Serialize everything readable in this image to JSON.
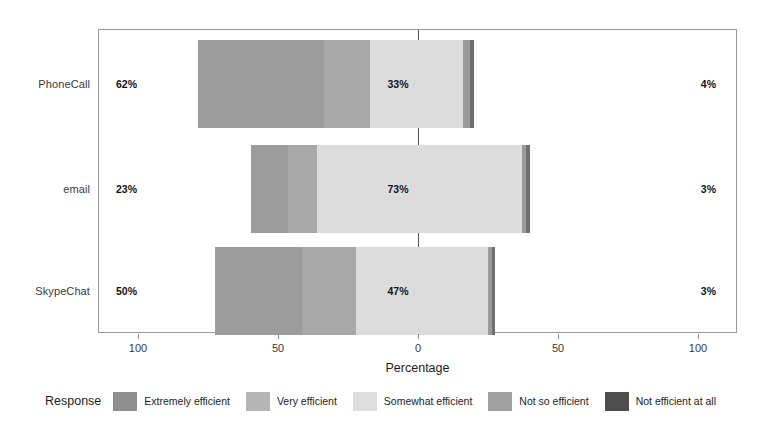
{
  "chart_data": {
    "type": "bar",
    "subtype": "diverging-stacked-likert",
    "title": "",
    "xlabel": "Percentage",
    "ylabel": "",
    "categories": [
      "PhoneCall",
      "email",
      "SkypeChat"
    ],
    "response_levels": [
      "Extremely efficient",
      "Very efficient",
      "Somewhat efficient",
      "Not so efficient",
      "Not efficient at all"
    ],
    "series": [
      {
        "name": "Extremely efficient",
        "values": [
          45,
          12,
          31
        ]
      },
      {
        "name": "Very efficient",
        "values": [
          17,
          11,
          19
        ]
      },
      {
        "name": "Somewhat efficient",
        "values": [
          33,
          73,
          47
        ]
      },
      {
        "name": "Not so efficient",
        "values": [
          3,
          2,
          2
        ]
      },
      {
        "name": "Not efficient at all",
        "values": [
          1,
          1,
          1
        ]
      }
    ],
    "bars": [
      {
        "category": "PhoneCall",
        "left_label": "62%",
        "center_label": "33%",
        "right_label": "4%",
        "start_pct": -78.5,
        "segments": [
          {
            "level": "Extremely efficient",
            "width_pct": 45.0,
            "color": "#9c9c9c"
          },
          {
            "level": "Very efficient",
            "width_pct": 16.5,
            "color": "#a8a8a8"
          },
          {
            "level": "Somewhat efficient",
            "width_pct": 33.0,
            "color": "#dcdcdc"
          },
          {
            "level": "Not so efficient",
            "width_pct": 2.5,
            "color": "#9a9a9a"
          },
          {
            "level": "Not efficient at all",
            "width_pct": 1.5,
            "color": "#6f6f6f"
          }
        ]
      },
      {
        "category": "email",
        "left_label": "23%",
        "center_label": "73%",
        "right_label": "3%",
        "start_pct": -59.5,
        "segments": [
          {
            "level": "Extremely efficient",
            "width_pct": 13.0,
            "color": "#9c9c9c"
          },
          {
            "level": "Very efficient",
            "width_pct": 10.5,
            "color": "#a8a8a8"
          },
          {
            "level": "Somewhat efficient",
            "width_pct": 73.0,
            "color": "#dcdcdc"
          },
          {
            "level": "Not so efficient",
            "width_pct": 1.5,
            "color": "#9a9a9a"
          },
          {
            "level": "Not efficient at all",
            "width_pct": 1.5,
            "color": "#6f6f6f"
          }
        ]
      },
      {
        "category": "SkypeChat",
        "left_label": "50%",
        "center_label": "47%",
        "right_label": "3%",
        "start_pct": -72.5,
        "segments": [
          {
            "level": "Extremely efficient",
            "width_pct": 31.0,
            "color": "#9c9c9c"
          },
          {
            "level": "Very efficient",
            "width_pct": 19.5,
            "color": "#a8a8a8"
          },
          {
            "level": "Somewhat efficient",
            "width_pct": 47.0,
            "color": "#dcdcdc"
          },
          {
            "level": "Not so efficient",
            "width_pct": 1.5,
            "color": "#9a9a9a"
          },
          {
            "level": "Not efficient at all",
            "width_pct": 1.0,
            "color": "#6f6f6f"
          }
        ]
      }
    ],
    "xticks": [
      {
        "value": -100,
        "label": "100"
      },
      {
        "value": -50,
        "label": "50"
      },
      {
        "value": 0,
        "label": "0"
      },
      {
        "value": 50,
        "label": "50"
      },
      {
        "value": 100,
        "label": "100"
      }
    ],
    "xlim": [
      -114,
      114
    ],
    "grid": false,
    "zero_line": true,
    "legend": {
      "title": "Response",
      "position": "bottom",
      "items": [
        {
          "label": "Extremely efficient",
          "color": "#8f8f8f"
        },
        {
          "label": "Very efficient",
          "color": "#b4b4b4"
        },
        {
          "label": "Somewhat efficient",
          "color": "#dedede"
        },
        {
          "label": "Not so efficient",
          "color": "#a0a0a0"
        },
        {
          "label": "Not efficient at all",
          "color": "#4e4e4e"
        }
      ]
    },
    "colors": {
      "extremely_efficient": "#9c9c9c",
      "very_efficient": "#a8a8a8",
      "somewhat_efficient": "#dcdcdc",
      "not_so_efficient": "#9a9a9a",
      "not_efficient_at_all": "#6f6f6f",
      "frame": "#9a9a9a",
      "text": "#1b1b1b",
      "background": "#ffffff"
    }
  }
}
